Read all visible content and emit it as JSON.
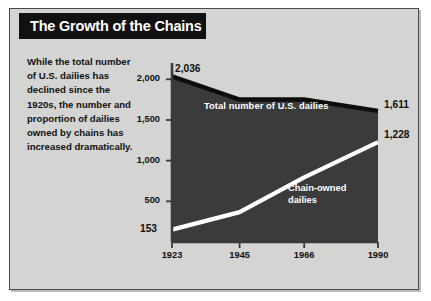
{
  "title": "The Growth of the Chains",
  "caption": "While the total number of U.S. dailies has declined since the 1920s, the number and proportion of dailies owned by chains has increased dramatically.",
  "colors": {
    "background": "#d4d4d2",
    "border": "#4a4a4a",
    "banner": "#111111",
    "banner_text": "#ffffff",
    "total_area": "#3b3b3b",
    "total_line": "#0d0d0d",
    "chain_line": "#ffffff",
    "axis": "#3a3a3a"
  },
  "labels": {
    "start_total": "2,036",
    "start_chain": "153",
    "end_total": "1,611",
    "end_chain": "1,228",
    "series_total": "Total number of U.S. dailies",
    "series_chain_line1": "Chain-owned",
    "series_chain_line2": "dailies"
  },
  "chart_data": {
    "type": "area",
    "title": "The Growth of the Chains",
    "xlabel": "",
    "ylabel": "",
    "categories": [
      "1923",
      "1945",
      "1966",
      "1990"
    ],
    "x": [
      1923,
      1945,
      1966,
      1990
    ],
    "xlim": [
      1923,
      1990
    ],
    "ylim": [
      0,
      2200
    ],
    "yticks": [
      500,
      1000,
      1500,
      2000
    ],
    "ytick_labels": [
      "500",
      "1,000",
      "1,500",
      "2,000"
    ],
    "xtick_labels": [
      "1923",
      "1945",
      "1966",
      "1990"
    ],
    "grid": false,
    "legend": "inline-annotations",
    "series": [
      {
        "name": "Total number of U.S. dailies",
        "values": [
          2036,
          1750,
          1751,
          1611
        ],
        "endpoint_labels": {
          "first": "2,036",
          "last": "1,611"
        },
        "style": "filled-area-dark"
      },
      {
        "name": "Chain-owned dailies",
        "values": [
          153,
          368,
          794,
          1228
        ],
        "endpoint_labels": {
          "first": "153",
          "last": "1,228"
        },
        "style": "white-line"
      }
    ]
  }
}
